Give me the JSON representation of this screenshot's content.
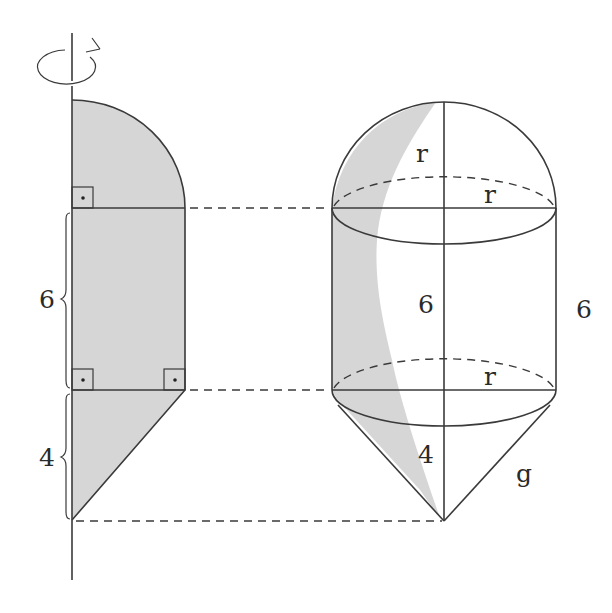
{
  "figure": {
    "colors": {
      "shade": "#d6d6d6",
      "line": "#3a3a3a",
      "background": "#ffffff"
    },
    "left_region": {
      "labels": {
        "cylinder_height": "6",
        "cone_height": "4"
      },
      "right_angle_markers": 3,
      "rotation_icon": "rotation-arrow-icon"
    },
    "solid": {
      "labels": {
        "hemisphere_radius": "r",
        "top_radius": "r",
        "inner_height": "6",
        "outer_height": "6",
        "bottom_radius": "r",
        "cone_height": "4",
        "slant_height": "g"
      }
    }
  }
}
